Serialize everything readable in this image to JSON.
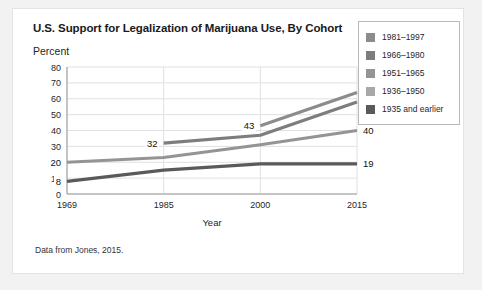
{
  "card": {
    "source_note": "Data from Jones, 2015."
  },
  "chart_data": {
    "type": "line",
    "title": "U.S. Support for Legalization of Marijuana Use, By Cohort",
    "ylabel": "Percent",
    "xlabel": "Year",
    "x": [
      1969,
      1985,
      2000,
      2015
    ],
    "xtick_labels": [
      "1969",
      "1985",
      "2000",
      "2015"
    ],
    "ylim": [
      0,
      80
    ],
    "ytick_labels": [
      "0",
      "10",
      "20",
      "30",
      "40",
      "50",
      "60",
      "70",
      "80"
    ],
    "grid": true,
    "legend_position": "right",
    "series": [
      {
        "name": "1981–1997",
        "color": "#8c8c8c",
        "x": [
          2000,
          2015
        ],
        "values": [
          43,
          64
        ],
        "point_labels": [
          {
            "x": 2000,
            "value": 43,
            "text": "43"
          },
          {
            "x": 2015,
            "value": 64,
            "text": "64"
          }
        ]
      },
      {
        "name": "1966–1980",
        "color": "#7d7d7d",
        "x": [
          1985,
          2000,
          2015
        ],
        "values": [
          32,
          37,
          58
        ],
        "point_labels": [
          {
            "x": 1985,
            "value": 32,
            "text": "32"
          },
          {
            "x": 2015,
            "value": 58,
            "text": "58"
          }
        ]
      },
      {
        "name": "1951–1965",
        "color": "#949494",
        "x": [
          1969,
          1985,
          2000,
          2015
        ],
        "values": [
          20,
          23,
          31,
          40
        ],
        "point_labels": [
          {
            "x": 1969,
            "value": 20,
            "text": "20"
          },
          {
            "x": 2015,
            "value": 40,
            "text": "40"
          }
        ]
      },
      {
        "name": "1936–1950",
        "color": "#a8a8a8",
        "x": [],
        "values": [],
        "point_labels": []
      },
      {
        "name": "1935 and earlier",
        "color": "#5a5a5a",
        "x": [
          1969,
          1985,
          2000,
          2015
        ],
        "values": [
          8,
          15,
          19,
          19
        ],
        "point_labels": [
          {
            "x": 1969,
            "value": 8,
            "text": "8"
          },
          {
            "x": 2015,
            "value": 19,
            "text": "19"
          }
        ]
      }
    ],
    "legend": [
      {
        "label": "1981–1997",
        "color": "#8c8c8c"
      },
      {
        "label": "1966–1980",
        "color": "#7d7d7d"
      },
      {
        "label": "1951–1965",
        "color": "#949494"
      },
      {
        "label": "1936–1950",
        "color": "#a8a8a8"
      },
      {
        "label": "1935 and earlier",
        "color": "#5a5a5a"
      }
    ],
    "colors": {
      "grid": "#e0e0e0",
      "axis": "#9a9a9a",
      "text": "#1f1f1f"
    }
  }
}
